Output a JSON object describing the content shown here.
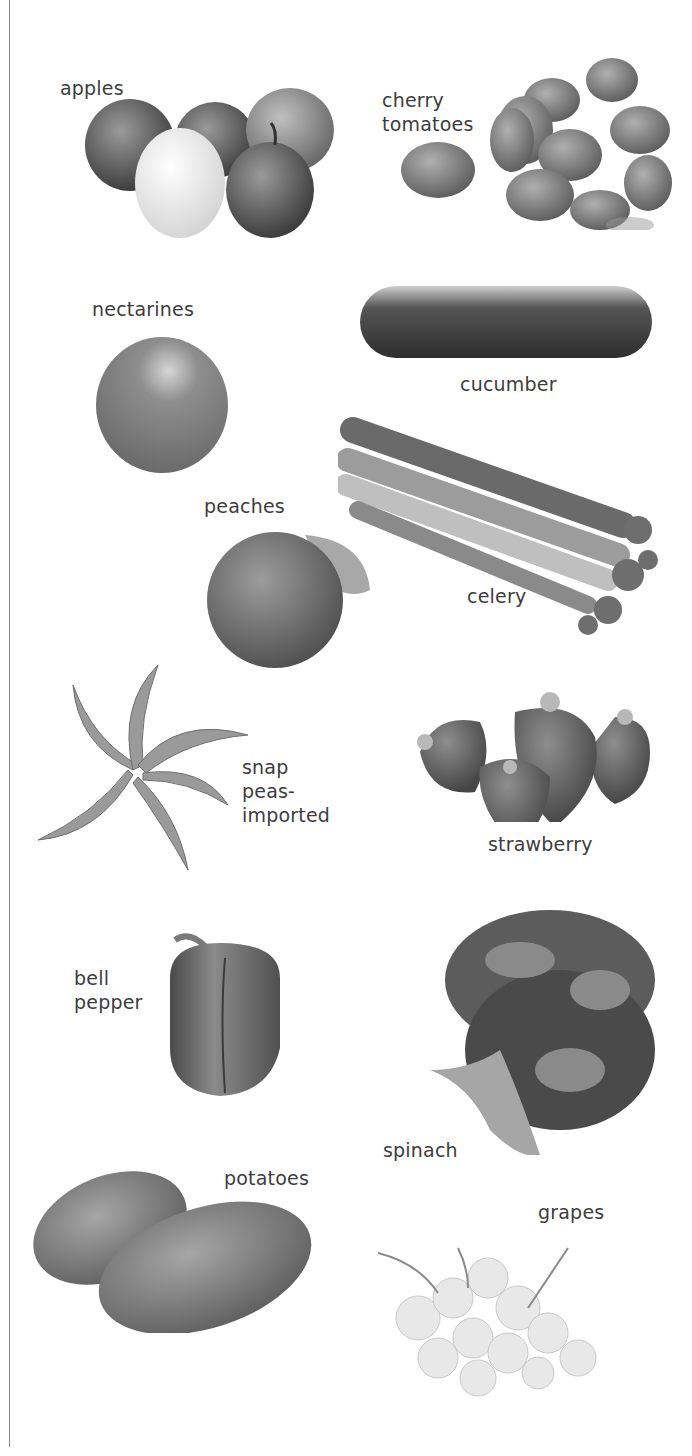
{
  "produce": [
    {
      "name": "apples",
      "label": "apples"
    },
    {
      "name": "cherry-tomatoes",
      "label": "cherry\ntomatoes"
    },
    {
      "name": "nectarines",
      "label": "nectarines"
    },
    {
      "name": "cucumber",
      "label": "cucumber"
    },
    {
      "name": "peaches",
      "label": "peaches"
    },
    {
      "name": "celery",
      "label": "celery"
    },
    {
      "name": "snap-peas-imported",
      "label": "snap\npeas-\nimported"
    },
    {
      "name": "strawberry",
      "label": "strawberry"
    },
    {
      "name": "bell-pepper",
      "label": "bell\npepper"
    },
    {
      "name": "spinach",
      "label": "spinach"
    },
    {
      "name": "potatoes",
      "label": "potatoes"
    },
    {
      "name": "grapes",
      "label": "grapes"
    }
  ],
  "colors": {
    "background": "#ffffff",
    "text": "#3d3d3d",
    "rule": "#8a8a8a"
  }
}
